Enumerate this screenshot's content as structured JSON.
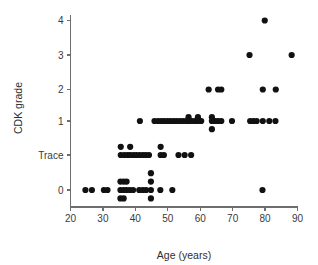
{
  "chart_data": {
    "type": "scatter",
    "title": "",
    "xlabel": "Age (years)",
    "ylabel": "CDK grade",
    "xlim": [
      20,
      90
    ],
    "ylim": [
      -0.55,
      4.35
    ],
    "grid": false,
    "legend": null,
    "x_ticks": [
      20,
      30,
      40,
      50,
      60,
      70,
      80,
      90
    ],
    "x_tick_labels": [
      "20",
      "30",
      "40",
      "50",
      "60",
      "70",
      "80",
      "90"
    ],
    "y_ticks": [
      0,
      0.5,
      1,
      2,
      3,
      4
    ],
    "y_tick_labels": [
      "0",
      "Trace",
      "1",
      "2",
      "3",
      "4"
    ],
    "marker": "circle",
    "marker_color": "#111111",
    "marker_size": 3.1,
    "x_label_name": "Age (years)",
    "y_label_name": "CDK grade",
    "points": [
      {
        "x": 24.6,
        "y": 0
      },
      {
        "x": 26.6,
        "y": 0
      },
      {
        "x": 30.3,
        "y": 0
      },
      {
        "x": 31.4,
        "y": 0
      },
      {
        "x": 35.4,
        "y": 0
      },
      {
        "x": 35.4,
        "y": 0.12
      },
      {
        "x": 35.4,
        "y": -0.12
      },
      {
        "x": 36.4,
        "y": 0
      },
      {
        "x": 36.4,
        "y": 0.12
      },
      {
        "x": 36.4,
        "y": -0.12
      },
      {
        "x": 37.3,
        "y": 0
      },
      {
        "x": 37.3,
        "y": 0.12
      },
      {
        "x": 38.3,
        "y": 0
      },
      {
        "x": 39.3,
        "y": 0
      },
      {
        "x": 41.2,
        "y": 0
      },
      {
        "x": 42.3,
        "y": 0
      },
      {
        "x": 43.3,
        "y": 0
      },
      {
        "x": 44.8,
        "y": 0
      },
      {
        "x": 44.8,
        "y": 0.12
      },
      {
        "x": 44.8,
        "y": 0.24
      },
      {
        "x": 44.8,
        "y": -0.12
      },
      {
        "x": 47.7,
        "y": 0
      },
      {
        "x": 51.4,
        "y": 0
      },
      {
        "x": 79.2,
        "y": 0
      },
      {
        "x": 35.5,
        "y": 0.5
      },
      {
        "x": 35.5,
        "y": 0.62
      },
      {
        "x": 36.6,
        "y": 0.5
      },
      {
        "x": 37.6,
        "y": 0.5
      },
      {
        "x": 38.4,
        "y": 0.5
      },
      {
        "x": 38.4,
        "y": 0.62
      },
      {
        "x": 39.4,
        "y": 0.5
      },
      {
        "x": 40.3,
        "y": 0.5
      },
      {
        "x": 41.3,
        "y": 0.5
      },
      {
        "x": 42.3,
        "y": 0.5
      },
      {
        "x": 43.2,
        "y": 0.5
      },
      {
        "x": 44.2,
        "y": 0.5
      },
      {
        "x": 47.8,
        "y": 0.5
      },
      {
        "x": 47.8,
        "y": 0.62
      },
      {
        "x": 48.8,
        "y": 0.5
      },
      {
        "x": 53.3,
        "y": 0.5
      },
      {
        "x": 55.2,
        "y": 0.5
      },
      {
        "x": 57.2,
        "y": 0.5
      },
      {
        "x": 41.4,
        "y": 1
      },
      {
        "x": 45.9,
        "y": 1
      },
      {
        "x": 47.0,
        "y": 1
      },
      {
        "x": 48.0,
        "y": 1
      },
      {
        "x": 48.9,
        "y": 1
      },
      {
        "x": 49.9,
        "y": 1
      },
      {
        "x": 50.8,
        "y": 1
      },
      {
        "x": 51.8,
        "y": 1
      },
      {
        "x": 52.7,
        "y": 1
      },
      {
        "x": 53.7,
        "y": 1
      },
      {
        "x": 54.7,
        "y": 1
      },
      {
        "x": 55.7,
        "y": 1
      },
      {
        "x": 56.4,
        "y": 1
      },
      {
        "x": 56.4,
        "y": 1.12
      },
      {
        "x": 57.4,
        "y": 1
      },
      {
        "x": 58.4,
        "y": 1
      },
      {
        "x": 59.3,
        "y": 1
      },
      {
        "x": 59.3,
        "y": 1.12
      },
      {
        "x": 60.3,
        "y": 1
      },
      {
        "x": 63.6,
        "y": 1
      },
      {
        "x": 63.6,
        "y": 1.12
      },
      {
        "x": 63.6,
        "y": 0.88
      },
      {
        "x": 64.6,
        "y": 1
      },
      {
        "x": 65.5,
        "y": 1
      },
      {
        "x": 66.5,
        "y": 1
      },
      {
        "x": 69.8,
        "y": 1
      },
      {
        "x": 75.4,
        "y": 1
      },
      {
        "x": 76.4,
        "y": 1
      },
      {
        "x": 77.4,
        "y": 1
      },
      {
        "x": 79.3,
        "y": 1
      },
      {
        "x": 81.3,
        "y": 1
      },
      {
        "x": 83.2,
        "y": 1
      },
      {
        "x": 62.6,
        "y": 2
      },
      {
        "x": 65.5,
        "y": 2
      },
      {
        "x": 66.5,
        "y": 2
      },
      {
        "x": 79.3,
        "y": 2
      },
      {
        "x": 83.3,
        "y": 2
      },
      {
        "x": 75.2,
        "y": 3
      },
      {
        "x": 88.2,
        "y": 3
      },
      {
        "x": 79.9,
        "y": 4
      }
    ]
  }
}
